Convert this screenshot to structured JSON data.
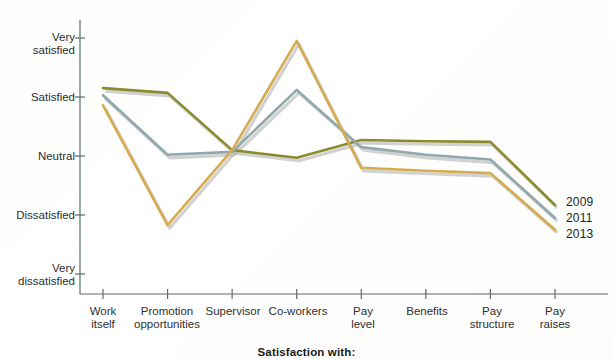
{
  "chart_data": {
    "type": "line",
    "title": "",
    "xlabel": "Satisfaction with:",
    "ylabel": "",
    "grid": false,
    "legend_position": "right-end-of-line",
    "categories": [
      "Work itself",
      "Promotion opportunities",
      "Supervisor",
      "Co-workers",
      "Pay level",
      "Benefits",
      "Pay structure",
      "Pay raises"
    ],
    "ytick_labels": [
      "Very satisfied",
      "Satisfied",
      "Neutral",
      "Dissatisfied",
      "Very dissatisfied"
    ],
    "ytick_values": [
      5,
      4,
      3,
      2,
      1
    ],
    "ylim": [
      0.75,
      5.35
    ],
    "series": [
      {
        "name": "2009",
        "color": "#8a8a2e",
        "values": [
          4.15,
          4.07,
          3.1,
          2.97,
          3.27,
          3.25,
          3.24,
          2.17
        ]
      },
      {
        "name": "2011",
        "color": "#8fa8ad",
        "values": [
          4.03,
          3.02,
          3.07,
          4.12,
          3.15,
          3.02,
          2.94,
          1.95
        ]
      },
      {
        "name": "2013",
        "color": "#d6ab4e",
        "values": [
          3.86,
          1.83,
          3.1,
          4.95,
          2.8,
          2.75,
          2.71,
          1.75
        ]
      }
    ]
  },
  "axis": {
    "title": "Satisfaction with:",
    "axis_color": "#5f6a6a"
  },
  "ytick_lines": [
    "Very\nsatisfied",
    "Satisfied",
    "Neutral",
    "Dissatisfied",
    "Very\ndissatisfied"
  ],
  "ytick_0_line1": "Very",
  "ytick_0_line2": "satisfied",
  "ytick_1_line1": "Satisfied",
  "ytick_2_line1": "Neutral",
  "ytick_3_line1": "Dissatisfied",
  "ytick_4_line1": "Very",
  "ytick_4_line2": "dissatisfied",
  "xtick_0_line1": "Work",
  "xtick_0_line2": "itself",
  "xtick_1_line1": "Promotion",
  "xtick_1_line2": "opportunities",
  "xtick_2_line1": "Supervisor",
  "xtick_3_line1": "Co-workers",
  "xtick_4_line1": "Pay",
  "xtick_4_line2": "level",
  "xtick_5_line1": "Benefits",
  "xtick_6_line1": "Pay",
  "xtick_6_line2": "structure",
  "xtick_7_line1": "Pay",
  "xtick_7_line2": "raises",
  "legend": {
    "item_0": "2009",
    "item_1": "2011",
    "item_2": "2013"
  }
}
